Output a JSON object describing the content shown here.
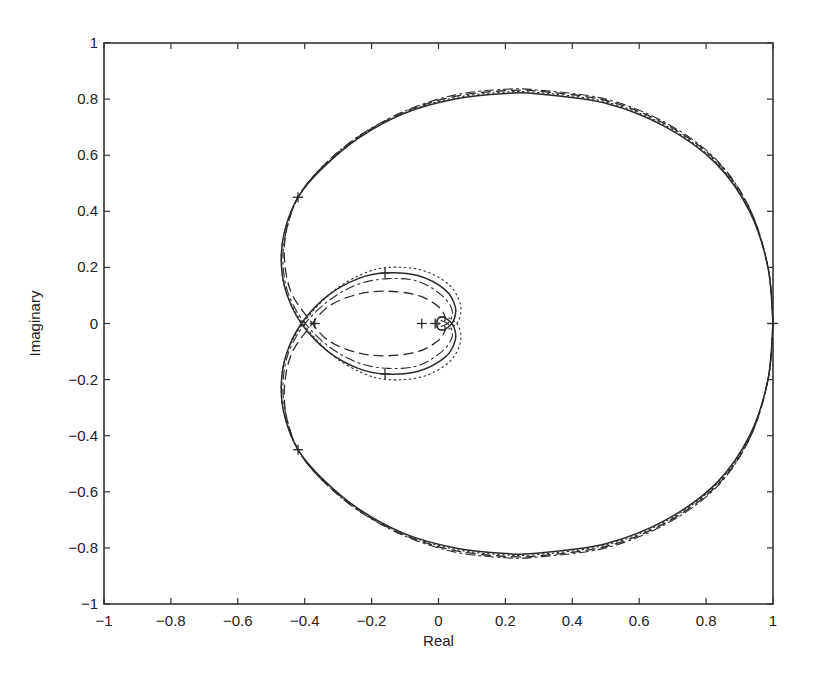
{
  "chart_data": {
    "type": "line",
    "title": "",
    "xlabel": "Real",
    "ylabel": "Imaginary",
    "xlim": [
      -1,
      1
    ],
    "ylim": [
      -1,
      1
    ],
    "grid": false,
    "legend": null,
    "xticks": [
      -1,
      -0.8,
      -0.6,
      -0.4,
      -0.2,
      0,
      0.2,
      0.4,
      0.6,
      0.8,
      1
    ],
    "xtick_labels": [
      "-1",
      "-0.8",
      "-0.6",
      "-0.4",
      "-0.2",
      "0",
      "0.2",
      "0.4",
      "0.6",
      "0.8",
      "1"
    ],
    "yticks": [
      -1,
      -0.8,
      -0.6,
      -0.4,
      -0.2,
      0,
      0.2,
      0.4,
      0.6,
      0.8,
      1
    ],
    "ytick_labels": [
      "-1",
      "-0.8",
      "-0.6",
      "-0.4",
      "-0.2",
      "0",
      "0.2",
      "0.4",
      "0.6",
      "0.8",
      "1"
    ],
    "series": [
      {
        "name": "solid",
        "style": "solid",
        "upper_branch": [
          [
            1,
            0
          ],
          [
            0.985,
            0.2
          ],
          [
            0.93,
            0.4
          ],
          [
            0.83,
            0.57
          ],
          [
            0.68,
            0.7
          ],
          [
            0.5,
            0.785
          ],
          [
            0.3,
            0.818
          ],
          [
            0.2,
            0.82
          ],
          [
            0.05,
            0.8
          ],
          [
            -0.1,
            0.75
          ],
          [
            -0.24,
            0.66
          ],
          [
            -0.35,
            0.55
          ],
          [
            -0.42,
            0.45
          ],
          [
            -0.46,
            0.33
          ],
          [
            -0.47,
            0.22
          ],
          [
            -0.455,
            0.11
          ],
          [
            -0.41,
            0
          ],
          [
            -0.33,
            -0.1
          ],
          [
            -0.24,
            -0.16
          ],
          [
            -0.16,
            -0.18
          ],
          [
            -0.06,
            -0.17
          ],
          [
            0.02,
            -0.12
          ],
          [
            0.05,
            -0.06
          ],
          [
            0.045,
            -0.01
          ],
          [
            0.02,
            0.02
          ],
          [
            0,
            0.02
          ],
          [
            -0.005,
            0
          ]
        ]
      },
      {
        "name": "dashed",
        "style": "dashed",
        "upper_branch": [
          [
            1,
            0
          ],
          [
            0.985,
            0.2
          ],
          [
            0.93,
            0.41
          ],
          [
            0.83,
            0.58
          ],
          [
            0.68,
            0.71
          ],
          [
            0.5,
            0.795
          ],
          [
            0.3,
            0.828
          ],
          [
            0.2,
            0.83
          ],
          [
            0.05,
            0.81
          ],
          [
            -0.1,
            0.755
          ],
          [
            -0.24,
            0.665
          ],
          [
            -0.35,
            0.555
          ],
          [
            -0.42,
            0.45
          ],
          [
            -0.455,
            0.33
          ],
          [
            -0.46,
            0.22
          ],
          [
            -0.44,
            0.11
          ],
          [
            -0.39,
            0.02
          ],
          [
            -0.33,
            -0.06
          ],
          [
            -0.24,
            -0.105
          ],
          [
            -0.15,
            -0.115
          ],
          [
            -0.06,
            -0.1
          ],
          [
            0,
            -0.06
          ],
          [
            0.02,
            -0.02
          ],
          [
            0.01,
            0
          ],
          [
            0,
            0
          ]
        ]
      },
      {
        "name": "dash-dot",
        "style": "dashdot",
        "upper_branch": [
          [
            1,
            0
          ],
          [
            0.985,
            0.2
          ],
          [
            0.93,
            0.41
          ],
          [
            0.83,
            0.585
          ],
          [
            0.68,
            0.715
          ],
          [
            0.5,
            0.8
          ],
          [
            0.3,
            0.832
          ],
          [
            0.2,
            0.835
          ],
          [
            0.05,
            0.815
          ],
          [
            -0.1,
            0.758
          ],
          [
            -0.24,
            0.667
          ],
          [
            -0.35,
            0.556
          ],
          [
            -0.42,
            0.45
          ],
          [
            -0.455,
            0.33
          ],
          [
            -0.465,
            0.22
          ],
          [
            -0.45,
            0.11
          ],
          [
            -0.405,
            0.01
          ],
          [
            -0.33,
            -0.08
          ],
          [
            -0.24,
            -0.14
          ],
          [
            -0.15,
            -0.16
          ],
          [
            -0.06,
            -0.15
          ],
          [
            0.01,
            -0.1
          ],
          [
            0.04,
            -0.05
          ],
          [
            0.035,
            -0.01
          ],
          [
            0.01,
            0.01
          ],
          [
            0,
            0
          ]
        ]
      },
      {
        "name": "dotted",
        "style": "dotted",
        "upper_branch": [
          [
            1,
            0
          ],
          [
            0.985,
            0.2
          ],
          [
            0.93,
            0.405
          ],
          [
            0.83,
            0.575
          ],
          [
            0.68,
            0.705
          ],
          [
            0.5,
            0.79
          ],
          [
            0.3,
            0.823
          ],
          [
            0.2,
            0.825
          ],
          [
            0.05,
            0.805
          ],
          [
            -0.1,
            0.752
          ],
          [
            -0.24,
            0.662
          ],
          [
            -0.35,
            0.552
          ],
          [
            -0.42,
            0.45
          ],
          [
            -0.46,
            0.33
          ],
          [
            -0.47,
            0.22
          ],
          [
            -0.455,
            0.11
          ],
          [
            -0.405,
            0
          ],
          [
            -0.32,
            -0.11
          ],
          [
            -0.23,
            -0.175
          ],
          [
            -0.15,
            -0.2
          ],
          [
            -0.05,
            -0.19
          ],
          [
            0.03,
            -0.14
          ],
          [
            0.065,
            -0.07
          ],
          [
            0.06,
            -0.01
          ],
          [
            0.03,
            0.02
          ],
          [
            0,
            0.02
          ],
          [
            -0.01,
            0
          ]
        ]
      }
    ],
    "markers": [
      {
        "x": 1.0,
        "y": 0.0,
        "symbol": "+"
      },
      {
        "x": -0.42,
        "y": 0.45,
        "symbol": "+"
      },
      {
        "x": -0.42,
        "y": -0.45,
        "symbol": "+"
      },
      {
        "x": -0.16,
        "y": 0.18,
        "symbol": "+"
      },
      {
        "x": -0.16,
        "y": -0.18,
        "symbol": "+"
      },
      {
        "x": -0.37,
        "y": 0.0,
        "symbol": "+"
      },
      {
        "x": -0.05,
        "y": 0.0,
        "symbol": "+"
      },
      {
        "x": -0.01,
        "y": 0.0,
        "symbol": "+"
      }
    ],
    "annotations": [],
    "colors": {
      "line": "#2a2a2a",
      "axis": "#333333",
      "background": "#ffffff"
    }
  },
  "layout": {
    "plot_left": 104,
    "plot_top": 43,
    "plot_right": 773,
    "plot_bottom": 604
  }
}
